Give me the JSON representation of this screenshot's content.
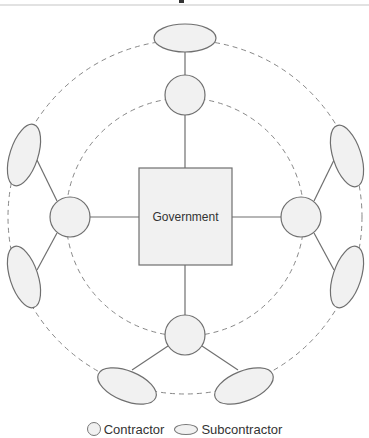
{
  "diagram": {
    "center": {
      "label": "Government",
      "shape": "square"
    },
    "contractors": [
      {
        "id": "top",
        "shape": "circle"
      },
      {
        "id": "left",
        "shape": "circle"
      },
      {
        "id": "right",
        "shape": "circle"
      },
      {
        "id": "bottom",
        "shape": "circle"
      }
    ],
    "subcontractors": [
      {
        "id": "top",
        "parent": "top",
        "shape": "ellipse"
      },
      {
        "id": "upper-left",
        "parent": "left",
        "shape": "ellipse"
      },
      {
        "id": "lower-left",
        "parent": "left",
        "shape": "ellipse"
      },
      {
        "id": "upper-right",
        "parent": "right",
        "shape": "ellipse"
      },
      {
        "id": "lower-right",
        "parent": "right",
        "shape": "ellipse"
      },
      {
        "id": "bottom-left",
        "parent": "bottom",
        "shape": "ellipse"
      },
      {
        "id": "bottom-right",
        "parent": "bottom",
        "shape": "ellipse"
      }
    ],
    "rings": [
      {
        "id": "inner-ring",
        "style": "dashed",
        "connects": "contractors"
      },
      {
        "id": "outer-ring",
        "style": "dashed",
        "connects": "subcontractors"
      }
    ]
  },
  "legend": {
    "contractor_label": "Contractor",
    "subcontractor_label": "Subcontractor"
  },
  "colors": {
    "stroke": "#6f6f6f",
    "fill": "#f1f1f1",
    "dash": "#888888",
    "text": "#333333"
  }
}
